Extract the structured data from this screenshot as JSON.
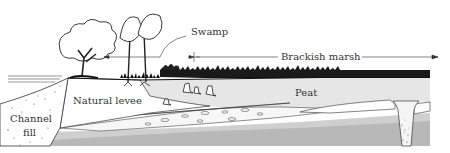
{
  "diagram": {
    "type": "geologic cross-section",
    "labels": {
      "swamp": "Swamp",
      "brackish_marsh": "Brackish marsh",
      "peat": "Peat",
      "natural_levee": "Natural levee",
      "channel_fill_line1": "Channel",
      "channel_fill_line2": "fill"
    },
    "colors": {
      "background": "#ffffff",
      "ink": "#222222",
      "peat_fill": "#e6e6e6",
      "lower_layer": "#bdbdbd",
      "mid_layer": "#d2d2d2",
      "levee_fill": "#ffffff"
    }
  }
}
